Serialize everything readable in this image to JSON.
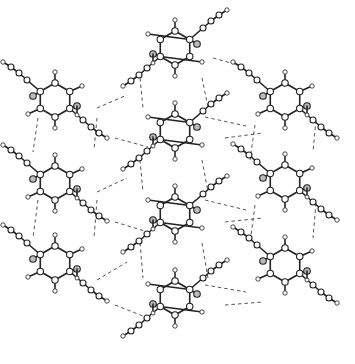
{
  "figure": {
    "type": "crystal packing (ORTEP-style ball-and-stick)",
    "width": 355,
    "height": 364,
    "colors": {
      "bond": "#222222",
      "hbond": "#444444",
      "background": "#ffffff",
      "oxygen_fill": "#bbbbbb"
    }
  },
  "molecules": [
    {
      "id": "L1",
      "cx": 55,
      "cy": 100,
      "flip": false
    },
    {
      "id": "L2",
      "cx": 55,
      "cy": 183,
      "flip": false
    },
    {
      "id": "L3",
      "cx": 55,
      "cy": 263,
      "flip": false
    },
    {
      "id": "M1",
      "cx": 175,
      "cy": 48,
      "flip": true
    },
    {
      "id": "M2",
      "cx": 175,
      "cy": 131,
      "flip": true
    },
    {
      "id": "M3",
      "cx": 175,
      "cy": 214,
      "flip": true
    },
    {
      "id": "M4",
      "cx": 175,
      "cy": 298,
      "flip": true
    },
    {
      "id": "R1",
      "cx": 285,
      "cy": 100,
      "flip": false
    },
    {
      "id": "R2",
      "cx": 285,
      "cy": 182,
      "flip": false
    },
    {
      "id": "R3",
      "cx": 285,
      "cy": 265,
      "flip": false
    }
  ],
  "hydrogen_bonds": [
    [
      38,
      118,
      33,
      152
    ],
    [
      97,
      108,
      127,
      95
    ],
    [
      97,
      118,
      94,
      150
    ],
    [
      115,
      138,
      148,
      147
    ],
    [
      140,
      78,
      143,
      108
    ],
    [
      202,
      78,
      208,
      107
    ],
    [
      213,
      58,
      242,
      66
    ],
    [
      205,
      117,
      246,
      126
    ],
    [
      225,
      138,
      263,
      133
    ],
    [
      255,
      125,
      250,
      160
    ],
    [
      316,
      120,
      313,
      152
    ],
    [
      38,
      200,
      33,
      238
    ],
    [
      97,
      192,
      127,
      178
    ],
    [
      97,
      200,
      94,
      238
    ],
    [
      115,
      222,
      148,
      232
    ],
    [
      140,
      160,
      143,
      192
    ],
    [
      202,
      160,
      208,
      192
    ],
    [
      205,
      200,
      246,
      210
    ],
    [
      225,
      222,
      263,
      218
    ],
    [
      255,
      205,
      250,
      243
    ],
    [
      316,
      203,
      313,
      238
    ],
    [
      97,
      280,
      127,
      262
    ],
    [
      115,
      305,
      148,
      318
    ],
    [
      140,
      243,
      143,
      278
    ],
    [
      202,
      243,
      208,
      278
    ],
    [
      205,
      285,
      246,
      292
    ],
    [
      225,
      305,
      263,
      302
    ]
  ]
}
